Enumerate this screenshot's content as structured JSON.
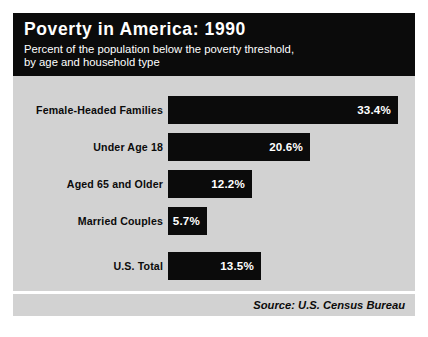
{
  "header": {
    "title": "Poverty in America: 1990",
    "subtitle_line1": "Percent of the population below the poverty threshold,",
    "subtitle_line2": "by age and household type",
    "background_color": "#0b0b0b",
    "text_color": "#ffffff"
  },
  "footer": {
    "source": "Source: U.S. Census Bureau"
  },
  "colors": {
    "panel_background": "#d2d2d2",
    "bar_fill": "#0b0b0b",
    "bar_value_text": "#ffffff",
    "label_text": "#0b0b0b",
    "page_background": "#ffffff"
  },
  "chart_data": {
    "type": "bar",
    "orientation": "horizontal",
    "title": "Poverty in America: 1990",
    "subtitle": "Percent of the population below the poverty threshold, by age and household type",
    "xlabel": "",
    "ylabel": "",
    "xlim": [
      0,
      35
    ],
    "grid": false,
    "legend": false,
    "source": "Source: U.S. Census Bureau",
    "unit": "%",
    "categories": [
      "Female-Headed Families",
      "Under Age 18",
      "Aged 65 and Older",
      "Married Couples",
      "U.S. Total"
    ],
    "values": [
      33.4,
      20.6,
      12.2,
      5.7,
      13.5
    ],
    "value_labels": [
      "33.4%",
      "20.6%",
      "12.2%",
      "5.7%",
      "13.5%"
    ],
    "bars": [
      {
        "label": "Female-Headed Families",
        "value": 33.4,
        "value_label": "33.4%"
      },
      {
        "label": "Under Age 18",
        "value": 20.6,
        "value_label": "20.6%"
      },
      {
        "label": "Aged 65 and Older",
        "value": 12.2,
        "value_label": "12.2%"
      },
      {
        "label": "Married Couples",
        "value": 5.7,
        "value_label": "5.7%"
      },
      {
        "label": "U.S. Total",
        "value": 13.5,
        "value_label": "13.5%"
      }
    ]
  }
}
